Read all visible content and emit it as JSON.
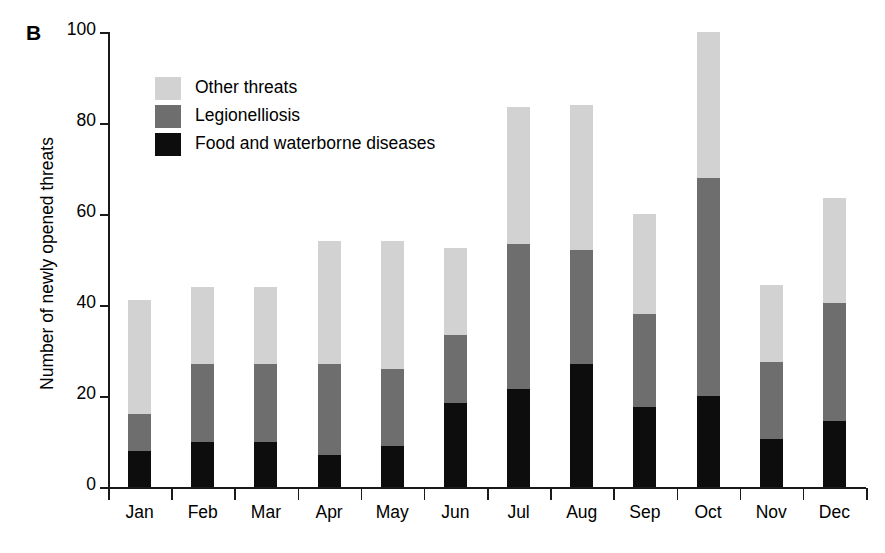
{
  "panel": {
    "label": "B"
  },
  "axes": {
    "ylabel": "Number of newly opened threats",
    "yticks": [
      "0",
      "20",
      "40",
      "60",
      "80",
      "100"
    ],
    "xticks": [
      "Jan",
      "Feb",
      "Mar",
      "Apr",
      "May",
      "Jun",
      "Jul",
      "Aug",
      "Sep",
      "Oct",
      "Nov",
      "Dec"
    ]
  },
  "legend": {
    "items": [
      {
        "label": "Other threats",
        "color": "#d2d2d2",
        "swatch_name": "legend-swatch-other-threats"
      },
      {
        "label": "Legionelliosis",
        "color": "#6e6e6e",
        "swatch_name": "legend-swatch-legionelliosis"
      },
      {
        "label": "Food and waterborne diseases",
        "color": "#0d0d0d",
        "swatch_name": "legend-swatch-food-waterborne"
      }
    ]
  },
  "chart_data": {
    "type": "bar",
    "stacked": true,
    "title": "",
    "xlabel": "",
    "ylabel": "Number of newly opened threats",
    "ylim": [
      0,
      100
    ],
    "yticks": [
      0,
      20,
      40,
      60,
      80,
      100
    ],
    "grid": false,
    "legend_position": "upper-left-inside",
    "categories": [
      "Jan",
      "Feb",
      "Mar",
      "Apr",
      "May",
      "Jun",
      "Jul",
      "Aug",
      "Sep",
      "Oct",
      "Nov",
      "Dec"
    ],
    "series": [
      {
        "name": "Food and waterborne diseases",
        "color": "#0d0d0d",
        "values": [
          8,
          10,
          10,
          7,
          9,
          18.5,
          21.5,
          27,
          17.5,
          20,
          10.5,
          14.5
        ]
      },
      {
        "name": "Legionelliosis",
        "color": "#6e6e6e",
        "values": [
          8,
          17,
          17,
          20,
          17,
          15,
          32,
          25,
          20.5,
          48,
          17,
          26
        ]
      },
      {
        "name": "Other threats",
        "color": "#d2d2d2",
        "values": [
          25,
          17,
          17,
          27,
          28,
          19,
          30,
          32,
          22,
          32,
          17,
          23
        ]
      }
    ],
    "totals": [
      41,
      44,
      44,
      54,
      54,
      52.5,
      83.5,
      84,
      60,
      100,
      44.5,
      63.5
    ]
  }
}
